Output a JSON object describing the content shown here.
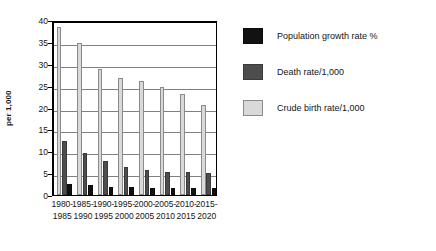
{
  "chart_data": {
    "type": "bar",
    "title": "",
    "xlabel": "",
    "ylabel": "per 1,000",
    "ylim": [
      0,
      40
    ],
    "ytick_step": 5,
    "yticks": [
      0,
      5,
      10,
      15,
      20,
      25,
      30,
      35,
      40
    ],
    "ytick_labels": [
      "0",
      "5",
      "10",
      "15",
      "20",
      "25",
      "30",
      "35",
      "40"
    ],
    "grid": true,
    "legend_position": "right",
    "categories": [
      "1980-\n1985",
      "1985-\n1990",
      "1990-\n1995",
      "1995-\n2000",
      "2000-\n2005",
      "2005-\n2010",
      "2010-\n2015",
      "2015-\n2020"
    ],
    "category_lines": [
      [
        "1980-",
        "1985"
      ],
      [
        "1985-",
        "1990"
      ],
      [
        "1990-",
        "1995"
      ],
      [
        "1995-",
        "2000"
      ],
      [
        "2000-",
        "2005"
      ],
      [
        "2005-",
        "2010"
      ],
      [
        "2010-",
        "2015"
      ],
      [
        "2015-",
        "2020"
      ]
    ],
    "series": [
      {
        "name": "Population growth rate %",
        "color": "#121212",
        "values": [
          2.5,
          2.2,
          1.9,
          1.8,
          1.7,
          1.7,
          1.6,
          1.5
        ]
      },
      {
        "name": "Death rate/1,000",
        "color": "#4d4d4d",
        "values": [
          12.3,
          9.6,
          7.8,
          6.3,
          5.7,
          5.3,
          5.2,
          5.0
        ]
      },
      {
        "name": "Crude birth rate/1,000",
        "color": "#d9d9d9",
        "values": [
          38.5,
          34.8,
          28.8,
          26.7,
          26.0,
          24.8,
          23.0,
          20.6
        ]
      }
    ]
  },
  "legend": {
    "items": [
      {
        "label": "Population growth rate %",
        "swatch": "legend-swatch-dark"
      },
      {
        "label": "Death rate/1,000",
        "swatch": "legend-swatch-gray"
      },
      {
        "label": "Crude birth rate/1,000",
        "swatch": "legend-swatch-light"
      }
    ]
  },
  "axis": {
    "y_title": "per 1,000"
  }
}
